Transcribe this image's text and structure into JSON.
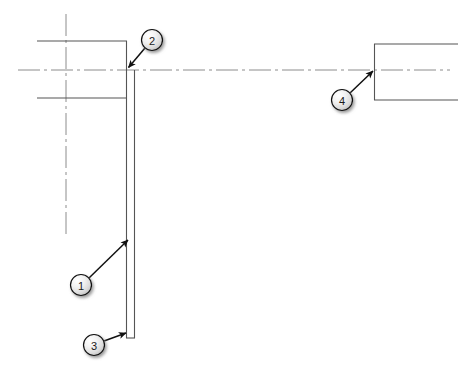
{
  "drawing": {
    "title": "Assembly Section View with Balloon Callouts",
    "width": 468,
    "height": 373,
    "background_color": "#ffffff",
    "line_color": "#4d4d4d",
    "centerline_color": "#808080",
    "leader_color": "#1a1a1a",
    "balloon_fill": "#e8e8e8",
    "balloon_stroke": "#1a1a1a",
    "balloon_text_color": "#1a1a1a",
    "shadow_color": "#9a9a9a"
  },
  "geometry": {
    "horizontal_centerline": {
      "name": "horizontal-centerline",
      "x1": 18,
      "y1": 70,
      "x2": 450,
      "y2": 70
    },
    "vertical_centerline": {
      "name": "vertical-centerline",
      "x1": 66,
      "y1": 14,
      "x2": 66,
      "y2": 238
    },
    "left_part_top_edge": {
      "name": "left-part-top-edge",
      "x1": 37,
      "y1": 41,
      "x2": 127,
      "y2": 41
    },
    "left_part_bottom_edge": {
      "name": "left-part-bottom-edge",
      "x1": 37,
      "y1": 98,
      "x2": 127,
      "y2": 98
    },
    "inner_vertical_edge": {
      "name": "inner-vertical-edge",
      "x1": 126,
      "y1": 41,
      "x2": 126,
      "y2": 338
    },
    "outer_vertical_edge": {
      "name": "outer-vertical-edge",
      "x1": 134,
      "y1": 70,
      "x2": 134,
      "y2": 338
    },
    "bottom_closing_edge": {
      "name": "bottom-closing-edge",
      "x1": 126,
      "y1": 338,
      "x2": 134,
      "y2": 338
    },
    "right_part_left_edge": {
      "name": "right-part-left-edge",
      "x1": 374,
      "y1": 44,
      "x2": 374,
      "y2": 100
    },
    "right_part_top_edge": {
      "name": "right-part-top-edge",
      "x1": 374,
      "y1": 44,
      "x2": 458,
      "y2": 44
    },
    "right_part_bottom_edge": {
      "name": "right-part-bottom-edge",
      "x1": 374,
      "y1": 100,
      "x2": 458,
      "y2": 100
    }
  },
  "callouts": [
    {
      "id": "1",
      "label": "1",
      "name": "balloon-callout-1",
      "circle": {
        "cx": 81,
        "cy": 285,
        "r": 10.5
      },
      "leader": {
        "x1": 89,
        "y1": 278,
        "x2": 128,
        "y2": 240
      },
      "arrow_angle_deg": -44.3
    },
    {
      "id": "2",
      "label": "2",
      "name": "balloon-callout-2",
      "circle": {
        "cx": 152,
        "cy": 40,
        "r": 10.5
      },
      "leader": {
        "x1": 145,
        "y1": 48,
        "x2": 128,
        "y2": 68
      },
      "arrow_angle_deg": 130.0
    },
    {
      "id": "3",
      "label": "3",
      "name": "balloon-callout-3",
      "circle": {
        "cx": 94,
        "cy": 345,
        "r": 10.5
      },
      "leader": {
        "x1": 104,
        "y1": 341,
        "x2": 126,
        "y2": 333
      },
      "arrow_angle_deg": -20.0
    },
    {
      "id": "4",
      "label": "4",
      "name": "balloon-callout-4",
      "circle": {
        "cx": 342,
        "cy": 100,
        "r": 10.5
      },
      "leader": {
        "x1": 350,
        "y1": 93,
        "x2": 373,
        "y2": 71
      },
      "arrow_angle_deg": -43.7
    }
  ]
}
